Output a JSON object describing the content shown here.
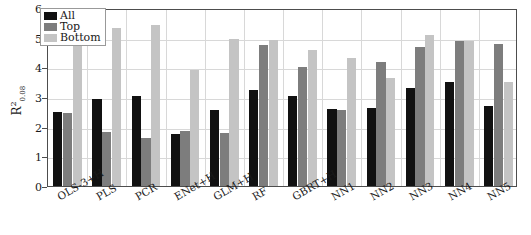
{
  "chart_data": {
    "type": "bar",
    "title": "",
    "xlabel": "",
    "ylabel": "R^2_{0.08}",
    "ylabel_parts": {
      "base": "R",
      "sup": "2",
      "sub": "0.08"
    },
    "ylim": [
      0,
      6
    ],
    "yticks": [
      0,
      1,
      2,
      3,
      4,
      5,
      6
    ],
    "ytick_labels": [
      "0",
      "1",
      "2",
      "3",
      "4",
      "5",
      "6"
    ],
    "grid": true,
    "legend_position": "upper-left",
    "categories": [
      "OLS-3+H",
      "PLS",
      "PCR",
      "ENet+H",
      "GLM+H",
      "RF",
      "GBRT+H",
      "NN1",
      "NN2",
      "NN3",
      "NN4",
      "NN5"
    ],
    "series": [
      {
        "name": "All",
        "color": "#111111",
        "values": [
          2.5,
          2.92,
          3.05,
          1.77,
          2.57,
          3.22,
          3.03,
          2.6,
          2.63,
          3.32,
          3.5,
          2.7
        ]
      },
      {
        "name": "Top",
        "color": "#7d7d7d",
        "values": [
          2.47,
          1.82,
          1.62,
          1.86,
          1.78,
          4.75,
          4.02,
          2.55,
          4.17,
          4.67,
          4.88,
          4.78
        ]
      },
      {
        "name": "Bottom",
        "color": "#c4c4c4",
        "values": [
          4.88,
          5.34,
          5.42,
          3.9,
          4.95,
          4.92,
          4.57,
          4.33,
          3.65,
          5.08,
          4.88,
          3.5
        ]
      }
    ]
  },
  "legend": {
    "items": [
      {
        "label": "All"
      },
      {
        "label": "Top"
      },
      {
        "label": "Bottom"
      }
    ]
  }
}
